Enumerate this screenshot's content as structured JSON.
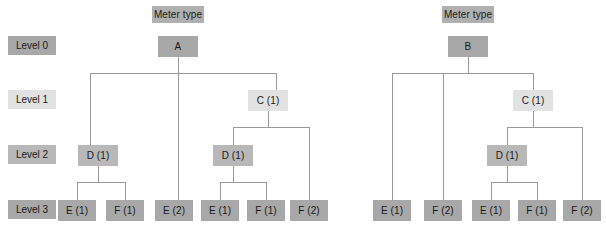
{
  "figure": {
    "background_color": "#ffffff",
    "line_color": "#9a9a9a",
    "text_color": "#1a1a1a"
  },
  "level_labels": [
    {
      "label": "Level 0",
      "tone": "dark",
      "x": 8,
      "y": 36,
      "w": 48,
      "h": 19
    },
    {
      "label": "Level 1",
      "tone": "light",
      "x": 8,
      "y": 90,
      "w": 48,
      "h": 19
    },
    {
      "label": "Level 2",
      "tone": "mid",
      "x": 8,
      "y": 145,
      "w": 48,
      "h": 19
    },
    {
      "label": "Level 3",
      "tone": "dark",
      "x": 8,
      "y": 200,
      "w": 48,
      "h": 19
    }
  ],
  "trees": [
    {
      "name": "meter-type-a",
      "title": {
        "label": "Meter type",
        "tone": "title",
        "x": 152,
        "y": 6,
        "w": 52,
        "h": 17
      },
      "nodes": [
        {
          "id": "a-root",
          "label": "A",
          "tone": "dark",
          "x": 158,
          "y": 36,
          "w": 40,
          "h": 21
        },
        {
          "id": "a-c1",
          "label": "C (1)",
          "tone": "light",
          "x": 248,
          "y": 90,
          "w": 40,
          "h": 21
        },
        {
          "id": "a-d1l",
          "label": "D (1)",
          "tone": "mid",
          "x": 78,
          "y": 145,
          "w": 40,
          "h": 21
        },
        {
          "id": "a-d1r",
          "label": "D (1)",
          "tone": "mid",
          "x": 213,
          "y": 145,
          "w": 40,
          "h": 21
        },
        {
          "id": "a-e1a",
          "label": "E (1)",
          "tone": "dark",
          "x": 58,
          "y": 200,
          "w": 38,
          "h": 21
        },
        {
          "id": "a-f1a",
          "label": "F (1)",
          "tone": "dark",
          "x": 106,
          "y": 200,
          "w": 38,
          "h": 21
        },
        {
          "id": "a-e2",
          "label": "E (2)",
          "tone": "dark",
          "x": 155,
          "y": 200,
          "w": 38,
          "h": 21
        },
        {
          "id": "a-e1b",
          "label": "E (1)",
          "tone": "dark",
          "x": 201,
          "y": 200,
          "w": 38,
          "h": 21
        },
        {
          "id": "a-f1b",
          "label": "F (1)",
          "tone": "dark",
          "x": 247,
          "y": 200,
          "w": 38,
          "h": 21
        },
        {
          "id": "a-f2",
          "label": "F (2)",
          "tone": "dark",
          "x": 290,
          "y": 200,
          "w": 38,
          "h": 21
        }
      ],
      "edges": [
        "M178,57 L178,73",
        "M90,73 L276,73",
        "M90,73 L90,145",
        "M178,73 L178,200",
        "M276,73 L276,90",
        "M268,111 L268,127",
        "M233,127 L309,127",
        "M233,127 L233,145",
        "M309,127 L309,200",
        "M98,166 L98,182",
        "M77,182 L125,182",
        "M77,182 L77,200",
        "M125,182 L125,200",
        "M233,166 L233,182",
        "M220,182 L266,182",
        "M220,182 L220,200",
        "M266,182 L266,200"
      ]
    },
    {
      "name": "meter-type-b",
      "title": {
        "label": "Meter type",
        "tone": "title",
        "x": 442,
        "y": 6,
        "w": 52,
        "h": 17
      },
      "nodes": [
        {
          "id": "b-root",
          "label": "B",
          "tone": "dark",
          "x": 448,
          "y": 36,
          "w": 40,
          "h": 21
        },
        {
          "id": "b-c1",
          "label": "C (1)",
          "tone": "light",
          "x": 513,
          "y": 90,
          "w": 40,
          "h": 21
        },
        {
          "id": "b-d1",
          "label": "D (1)",
          "tone": "mid",
          "x": 487,
          "y": 145,
          "w": 40,
          "h": 21
        },
        {
          "id": "b-e1a",
          "label": "E (1)",
          "tone": "dark",
          "x": 373,
          "y": 200,
          "w": 38,
          "h": 21
        },
        {
          "id": "b-f2a",
          "label": "F (2)",
          "tone": "dark",
          "x": 424,
          "y": 200,
          "w": 38,
          "h": 21
        },
        {
          "id": "b-e1b",
          "label": "E (1)",
          "tone": "dark",
          "x": 472,
          "y": 200,
          "w": 38,
          "h": 21
        },
        {
          "id": "b-f1",
          "label": "F (1)",
          "tone": "dark",
          "x": 518,
          "y": 200,
          "w": 38,
          "h": 21
        },
        {
          "id": "b-f2b",
          "label": "F (2)",
          "tone": "dark",
          "x": 563,
          "y": 200,
          "w": 38,
          "h": 21
        }
      ],
      "edges": [
        "M468,57 L468,73",
        "M392,73 L533,73",
        "M392,73 L392,200",
        "M443,73 L443,200",
        "M533,73 L533,90",
        "M533,111 L533,127",
        "M507,127 L582,127",
        "M507,127 L507,145",
        "M582,127 L582,200",
        "M507,166 L507,182",
        "M491,182 L537,182",
        "M491,182 L491,200",
        "M537,182 L537,200"
      ]
    }
  ]
}
